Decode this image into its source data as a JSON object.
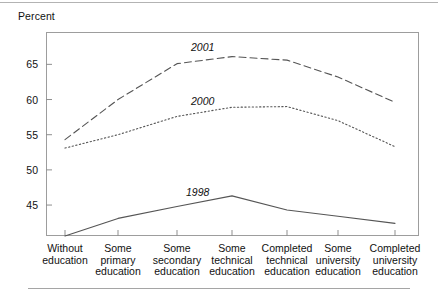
{
  "figure": {
    "ylabel": "Percent",
    "rules": {
      "top": "horizontal-rule",
      "bottom": "horizontal-rule"
    }
  },
  "chart_data": {
    "type": "line",
    "title": "",
    "xlabel": "",
    "ylabel": "Percent",
    "ylim": [
      40.6,
      69.6
    ],
    "yticks": [
      45,
      50,
      55,
      60,
      65
    ],
    "ytick_labels": [
      "45",
      "50",
      "55",
      "60",
      "65"
    ],
    "grid": false,
    "legend": "inline-annotations",
    "categories": [
      "Without education",
      "Some primary education",
      "Some secondary education",
      "Some technical education",
      "Completed technical education",
      "Some university education",
      "Completed university education"
    ],
    "category_lines": [
      [
        "Without",
        "education"
      ],
      [
        "Some",
        "primary",
        "education"
      ],
      [
        "Some",
        "secondary",
        "education"
      ],
      [
        "Some",
        "technical",
        "education"
      ],
      [
        "Completed",
        "technical",
        "education"
      ],
      [
        "Some",
        "university",
        "education"
      ],
      [
        "Completed",
        "university",
        "education"
      ]
    ],
    "series": [
      {
        "name": "1998",
        "style": "solid",
        "color": "#555555",
        "values": [
          40.6,
          43.1,
          44.8,
          46.3,
          44.3,
          43.4,
          42.4
        ]
      },
      {
        "name": "2000",
        "style": "dotted",
        "color": "#555555",
        "values": [
          53.1,
          55.0,
          57.6,
          58.9,
          59.0,
          57.0,
          53.3
        ]
      },
      {
        "name": "2001",
        "style": "dashed",
        "color": "#555555",
        "values": [
          54.3,
          60.0,
          65.1,
          66.1,
          65.6,
          63.2,
          59.6
        ]
      }
    ],
    "annotations": [
      {
        "text": "2001",
        "x_px": 191,
        "y_px": 41
      },
      {
        "text": "2000",
        "x_px": 191,
        "y_px": 95
      },
      {
        "text": "1998",
        "x_px": 186,
        "y_px": 186
      }
    ]
  }
}
